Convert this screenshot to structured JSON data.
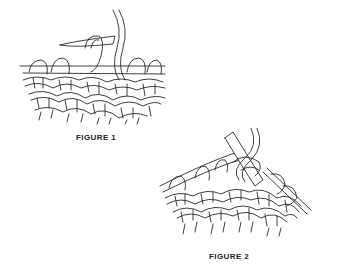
{
  "figures": [
    {
      "id": "figure-1",
      "caption": "FIGURE 1",
      "description": "Knitting illustration: right needle inserted into stitch on left needle with working yarn hanging from above"
    },
    {
      "id": "figure-2",
      "caption": "FIGURE 2",
      "description": "Knitting illustration: working yarn wrapped around right needle tip, stitches on left needle"
    }
  ],
  "colors": {
    "line": "#2a2a2a",
    "background": "#ffffff",
    "caption": "#222222"
  }
}
